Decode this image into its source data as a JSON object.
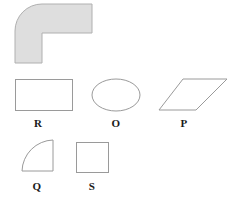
{
  "figure": {
    "width": 239,
    "height": 203,
    "background_color": "#ffffff"
  },
  "colors": {
    "shape_fill": "#dedede",
    "shape_stroke": "#b0b0b0",
    "outline_stroke": "#9a9a9a",
    "label_color": "#1a1a1a"
  },
  "composite_shape": {
    "name": "elbow-shape",
    "description": "L-shaped elbow with rounded outer corner",
    "fill": "#dedede",
    "stroke": "#b0b0b0",
    "bounds": {
      "x": 15,
      "y": 4,
      "width": 77,
      "height": 59
    },
    "inner_corner": {
      "x": 42,
      "y": 33
    },
    "corner_radius": 28,
    "path": "M 42 4 L 92 4 L 92 33 L 42 33 L 42 63 L 15 63 L 15 31 A 27 27 0 0 1 42 4 Z"
  },
  "shapes": [
    {
      "id": "rectangle-r",
      "label": "R",
      "type": "rectangle",
      "x": 15,
      "y": 79,
      "width": 57,
      "height": 31,
      "label_x": 38,
      "label_y": 118
    },
    {
      "id": "ellipse-o",
      "label": "O",
      "type": "ellipse",
      "cx": 116,
      "cy": 95,
      "rx": 24,
      "ry": 16,
      "label_x": 116,
      "label_y": 118
    },
    {
      "id": "parallelogram-p",
      "label": "P",
      "type": "parallelogram",
      "points": "183,79 227,79 196,110 159,110",
      "label_x": 184,
      "label_y": 118
    },
    {
      "id": "quarter-circle-q",
      "label": "Q",
      "type": "quarter-circle",
      "path": "M 22 171 A 32 32 0 0 1 53 140 L 53 171 Z",
      "label_x": 37,
      "label_y": 181
    },
    {
      "id": "square-s",
      "label": "S",
      "type": "square",
      "x": 76,
      "y": 142,
      "width": 32,
      "height": 30,
      "label_x": 92,
      "label_y": 181
    }
  ],
  "labels": {
    "r": "R",
    "o": "O",
    "p": "P",
    "q": "Q",
    "s": "S"
  }
}
